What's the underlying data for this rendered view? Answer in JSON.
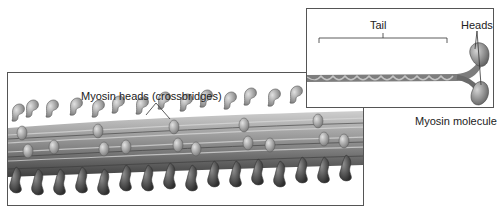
{
  "figure": {
    "filament_panel": {
      "callout_label": "Myosin heads (crossbridges)"
    },
    "molecule_panel": {
      "tail_label": "Tail",
      "heads_label": "Heads",
      "caption": "Myosin molecule"
    },
    "colors": {
      "protein_light": "#b9b9b9",
      "protein_mid": "#8a8a8a",
      "protein_dark": "#4a4a4a",
      "border": "#555555"
    }
  }
}
